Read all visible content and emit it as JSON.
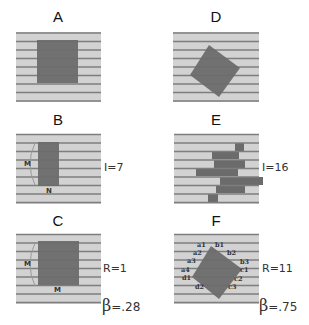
{
  "colors": {
    "background": "#ffffff",
    "panel_fill": "#d2d2d2",
    "line": "#7e7e7e",
    "object": "#6b6b6b",
    "arc": "#9a9a9a"
  },
  "panels": [
    {
      "id": "A",
      "title": "A",
      "description": "Axis-aligned square over horizontal lines"
    },
    {
      "id": "B",
      "title": "B",
      "description": "Narrow rectangle with M (height) and N (width) dimension labels",
      "measure_label": "I=7",
      "dim_labels": [
        "M",
        "N"
      ]
    },
    {
      "id": "C",
      "title": "C",
      "description": "Square with M height and M width labels",
      "measure_label": "R=1",
      "beta_label": "=.28",
      "beta_symbol": "β",
      "dim_labels": [
        "M",
        "M"
      ]
    },
    {
      "id": "D",
      "title": "D",
      "description": "Rotated square over horizontal lines"
    },
    {
      "id": "E",
      "title": "E",
      "description": "Scrambled row segments forming irregular shape",
      "measure_label": "I=16"
    },
    {
      "id": "F",
      "title": "F",
      "description": "Rotated square with edge-crossing labels",
      "measure_label": "R=11",
      "beta_label": "=.75",
      "beta_symbol": "β",
      "edge_labels": {
        "a": [
          "a1",
          "a2",
          "a3",
          "a4"
        ],
        "b": [
          "b1",
          "b2",
          "b3"
        ],
        "c": [
          "c1",
          "c2",
          "c3"
        ],
        "d": [
          "d1",
          "d2"
        ]
      }
    }
  ]
}
